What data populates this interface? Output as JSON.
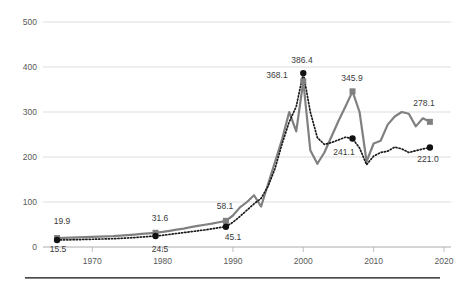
{
  "chart_data": {
    "type": "line",
    "title": "",
    "subtitle": "",
    "xlabel": "",
    "ylabel": "",
    "xlim": [
      1963,
      2021
    ],
    "ylim": [
      0,
      500
    ],
    "grid": true,
    "legend": "none",
    "y_ticks": [
      0,
      100,
      200,
      300,
      400,
      500
    ],
    "y_tick_labels": [
      "0",
      "100",
      "200",
      "300",
      "400",
      "500"
    ],
    "x_ticks": [
      1970,
      1980,
      1990,
      2000,
      2010,
      2020
    ],
    "x_tick_labels": [
      "1970",
      "1980",
      "1990",
      "2000",
      "2010",
      "2020"
    ],
    "series": [
      {
        "name": "solid-gray-series",
        "color": "#808080",
        "style": "solid",
        "marker": "square",
        "x": [
          1965,
          1966,
          1967,
          1968,
          1969,
          1970,
          1971,
          1972,
          1973,
          1974,
          1975,
          1976,
          1977,
          1978,
          1979,
          1980,
          1981,
          1982,
          1983,
          1984,
          1985,
          1986,
          1987,
          1988,
          1989,
          1990,
          1991,
          1992,
          1993,
          1994,
          1995,
          1996,
          1997,
          1998,
          1999,
          2000,
          2001,
          2002,
          2003,
          2004,
          2005,
          2006,
          2007,
          2008,
          2009,
          2010,
          2011,
          2012,
          2013,
          2014,
          2015,
          2016,
          2017,
          2018
        ],
        "values": [
          19.9,
          20.3,
          20.8,
          21.2,
          21.8,
          22.3,
          22.9,
          23.6,
          24.2,
          25.2,
          26.3,
          27.6,
          29.1,
          30.4,
          31.6,
          33.5,
          36.0,
          38.5,
          41.0,
          44.0,
          47.0,
          49.5,
          52.0,
          55.0,
          58.1,
          70.0,
          88.0,
          100.0,
          115.0,
          90.0,
          140.0,
          190.0,
          240.0,
          300.0,
          257.0,
          368.1,
          215.0,
          185.0,
          210.0,
          245.0,
          280.0,
          312.0,
          345.9,
          300.0,
          190.0,
          230.0,
          236.0,
          272.0,
          290.0,
          300.0,
          296.0,
          268.0,
          286.0,
          278.1
        ]
      },
      {
        "name": "dotted-black-series",
        "color": "#111111",
        "style": "dotted",
        "marker": "circle",
        "x": [
          1965,
          1966,
          1967,
          1968,
          1969,
          1970,
          1971,
          1972,
          1973,
          1974,
          1975,
          1976,
          1977,
          1978,
          1979,
          1980,
          1981,
          1982,
          1983,
          1984,
          1985,
          1986,
          1987,
          1988,
          1989,
          1990,
          1991,
          1992,
          1993,
          1994,
          1995,
          1996,
          1997,
          1998,
          1999,
          2000,
          2001,
          2002,
          2003,
          2004,
          2005,
          2006,
          2007,
          2008,
          2009,
          2010,
          2011,
          2012,
          2013,
          2014,
          2015,
          2016,
          2017,
          2018
        ],
        "values": [
          15.5,
          15.8,
          16.1,
          16.4,
          16.8,
          17.2,
          17.6,
          18.0,
          18.4,
          19.2,
          20.0,
          21.0,
          22.2,
          23.3,
          24.5,
          26.0,
          28.0,
          30.0,
          32.0,
          34.0,
          36.0,
          38.0,
          40.5,
          43.0,
          45.1,
          55.0,
          68.0,
          82.0,
          96.0,
          108.0,
          135.0,
          175.0,
          230.0,
          278.0,
          312.0,
          386.4,
          300.0,
          243.0,
          228.0,
          232.0,
          238.0,
          244.0,
          241.1,
          220.0,
          183.0,
          202.0,
          210.0,
          213.0,
          222.0,
          218.0,
          210.0,
          214.0,
          218.0,
          221.0
        ]
      }
    ],
    "point_labels": [
      {
        "text": "19.9",
        "x": 1965,
        "value": 19.9,
        "series": "solid-gray-series",
        "px": 62,
        "py": 224
      },
      {
        "text": "15.5",
        "x": 1965,
        "value": 15.5,
        "series": "dotted-black-series",
        "px": 58,
        "py": 252
      },
      {
        "text": "31.6",
        "x": 1979,
        "value": 31.6,
        "series": "solid-gray-series",
        "px": 160,
        "py": 221
      },
      {
        "text": "24.5",
        "x": 1979,
        "value": 24.5,
        "series": "dotted-black-series",
        "px": 160,
        "py": 252
      },
      {
        "text": "58.1",
        "x": 1989,
        "value": 58.1,
        "series": "solid-gray-series",
        "px": 225,
        "py": 209
      },
      {
        "text": "45.1",
        "x": 1989,
        "value": 45.1,
        "series": "dotted-black-series",
        "px": 233,
        "py": 240
      },
      {
        "text": "386.4",
        "x": 2000,
        "value": 386.4,
        "series": "dotted-black-series",
        "px": 302,
        "py": 63
      },
      {
        "text": "368.1",
        "x": 2000,
        "value": 368.1,
        "series": "solid-gray-series",
        "px": 277,
        "py": 78
      },
      {
        "text": "345.9",
        "x": 2007,
        "value": 345.9,
        "series": "solid-gray-series",
        "px": 352,
        "py": 81
      },
      {
        "text": "241.1",
        "x": 2007,
        "value": 241.1,
        "series": "dotted-black-series",
        "px": 344,
        "py": 155
      },
      {
        "text": "278.1",
        "x": 2018,
        "value": 278.1,
        "series": "solid-gray-series",
        "px": 424,
        "py": 106
      },
      {
        "text": "221.0",
        "x": 2018,
        "value": 221.0,
        "series": "dotted-black-series",
        "px": 428,
        "py": 162
      }
    ],
    "markers": [
      {
        "series": "solid-gray-series",
        "x": 1965,
        "value": 19.9
      },
      {
        "series": "solid-gray-series",
        "x": 1979,
        "value": 31.6
      },
      {
        "series": "solid-gray-series",
        "x": 1989,
        "value": 58.1
      },
      {
        "series": "solid-gray-series",
        "x": 2000,
        "value": 368.1
      },
      {
        "series": "solid-gray-series",
        "x": 2007,
        "value": 345.9
      },
      {
        "series": "solid-gray-series",
        "x": 2018,
        "value": 278.1
      },
      {
        "series": "dotted-black-series",
        "x": 1965,
        "value": 15.5
      },
      {
        "series": "dotted-black-series",
        "x": 1979,
        "value": 24.5
      },
      {
        "series": "dotted-black-series",
        "x": 1989,
        "value": 45.1
      },
      {
        "series": "dotted-black-series",
        "x": 2000,
        "value": 386.4
      },
      {
        "series": "dotted-black-series",
        "x": 2007,
        "value": 241.1
      },
      {
        "series": "dotted-black-series",
        "x": 2018,
        "value": 221.0
      }
    ],
    "colors": {
      "solid_series": "#808080",
      "dotted_series": "#111111",
      "gridline": "#d4d4d4",
      "tick_text": "#595959",
      "label_text": "#3a3a3a",
      "footer_rule": "#4a4a4a",
      "background": "#ffffff"
    }
  }
}
